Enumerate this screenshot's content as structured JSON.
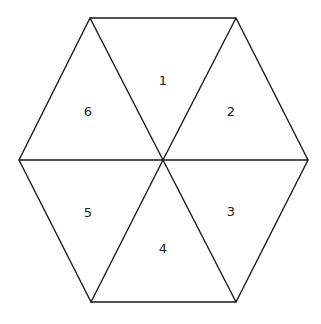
{
  "diagram": {
    "type": "hexagon-divided-into-triangles",
    "colors": {
      "background": "#ffffff",
      "stroke": "#1a1a1a",
      "text": "#222222"
    },
    "center": {
      "x": 163,
      "y": 160
    },
    "vertices": [
      {
        "id": "top-left",
        "x": 90,
        "y": 18
      },
      {
        "id": "top-right",
        "x": 236,
        "y": 18
      },
      {
        "id": "right",
        "x": 308,
        "y": 160
      },
      {
        "id": "bottom-right",
        "x": 236,
        "y": 302
      },
      {
        "id": "bottom-left",
        "x": 91,
        "y": 302
      },
      {
        "id": "left",
        "x": 19,
        "y": 160
      }
    ],
    "triangles": [
      {
        "label": "1",
        "x": 163,
        "y": 80
      },
      {
        "label": "2",
        "x": 231,
        "y": 111
      },
      {
        "label": "3",
        "x": 231,
        "y": 211
      },
      {
        "label": "4",
        "x": 163,
        "y": 248
      },
      {
        "label": "5",
        "x": 88,
        "y": 212
      },
      {
        "label": "6",
        "x": 88,
        "y": 111
      }
    ]
  }
}
